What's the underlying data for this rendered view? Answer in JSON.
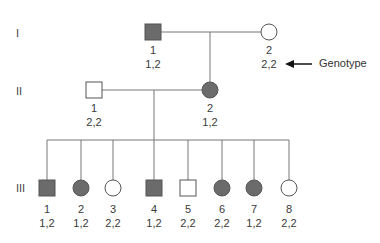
{
  "generations": [
    {
      "label": "I",
      "y": 34
    },
    {
      "label": "II",
      "y": 92
    },
    {
      "label": "III",
      "y": 189
    }
  ],
  "individuals": [
    {
      "gen": "I",
      "num": "1",
      "genotype": "1,2",
      "sex": "male",
      "affected": true,
      "x": 153,
      "y": 32
    },
    {
      "gen": "I",
      "num": "2",
      "genotype": "2,2",
      "sex": "female",
      "affected": false,
      "x": 269,
      "y": 32
    },
    {
      "gen": "II",
      "num": "1",
      "genotype": "2,2",
      "sex": "male",
      "affected": false,
      "x": 94,
      "y": 90
    },
    {
      "gen": "II",
      "num": "2",
      "genotype": "1,2",
      "sex": "female",
      "affected": true,
      "x": 210,
      "y": 90
    },
    {
      "gen": "III",
      "num": "1",
      "genotype": "1,2",
      "sex": "male",
      "affected": true,
      "x": 47,
      "y": 188
    },
    {
      "gen": "III",
      "num": "2",
      "genotype": "1,2",
      "sex": "female",
      "affected": true,
      "x": 81,
      "y": 188
    },
    {
      "gen": "III",
      "num": "3",
      "genotype": "2,2",
      "sex": "female",
      "affected": false,
      "x": 113,
      "y": 188
    },
    {
      "gen": "III",
      "num": "4",
      "genotype": "1,2",
      "sex": "male",
      "affected": true,
      "x": 154,
      "y": 188
    },
    {
      "gen": "III",
      "num": "5",
      "genotype": "2,2",
      "sex": "male",
      "affected": false,
      "x": 188,
      "y": 188
    },
    {
      "gen": "III",
      "num": "6",
      "genotype": "2,2",
      "sex": "female",
      "affected": true,
      "x": 222,
      "y": 188
    },
    {
      "gen": "III",
      "num": "7",
      "genotype": "1,2",
      "sex": "female",
      "affected": true,
      "x": 254,
      "y": 188
    },
    {
      "gen": "III",
      "num": "8",
      "genotype": "2,2",
      "sex": "female",
      "affected": false,
      "x": 289,
      "y": 188
    }
  ],
  "annotation": {
    "text": "Genotype",
    "arrow": "left-arrow"
  },
  "colors": {
    "affected_fill": "#6b6b6b",
    "outline": "#555555",
    "line": "#777777"
  }
}
